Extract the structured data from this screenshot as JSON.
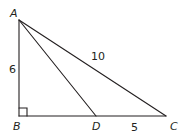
{
  "figure": {
    "type": "geometry-triangle",
    "vertices": {
      "A": {
        "label": "A",
        "x": 19,
        "y": 20
      },
      "B": {
        "label": "B",
        "x": 19,
        "y": 116
      },
      "C": {
        "label": "C",
        "x": 166,
        "y": 116
      },
      "D": {
        "label": "D",
        "x": 96,
        "y": 116
      }
    },
    "segments": [
      {
        "from": "A",
        "to": "B",
        "length_label": "6"
      },
      {
        "from": "A",
        "to": "C",
        "length_label": "10"
      },
      {
        "from": "D",
        "to": "C",
        "length_label": "5"
      },
      {
        "from": "B",
        "to": "D",
        "length_label": ""
      },
      {
        "from": "A",
        "to": "D",
        "length_label": ""
      }
    ],
    "right_angle_at": "B",
    "labels": {
      "A": "A",
      "B": "B",
      "C": "C",
      "D": "D",
      "AB": "6",
      "AC": "10",
      "DC": "5"
    },
    "colors": {
      "line": "#231f20",
      "background": "#ffffff"
    }
  }
}
